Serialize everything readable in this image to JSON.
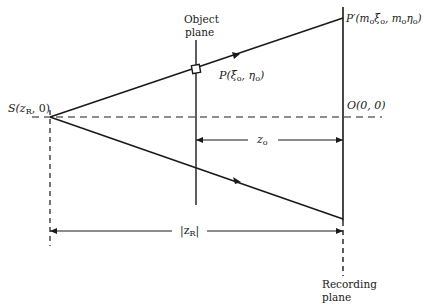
{
  "diagram": {
    "type": "holographic-recording-geometry",
    "labels": {
      "source": "S(z",
      "source_sub": "R",
      "source_tail": ", 0)",
      "object_plane_line1": "Object",
      "object_plane_line2": "plane",
      "object_point": "P(ξ",
      "object_point_sub1": "o",
      "object_point_mid": ", η",
      "object_point_sub2": "o",
      "object_point_tail": ")",
      "image_point": "P′(m",
      "image_point_sub1": "o",
      "image_point_mid1": "ξ",
      "image_point_sub2": "o",
      "image_point_mid2": ", m",
      "image_point_sub3": "o",
      "image_point_mid3": "η",
      "image_point_sub4": "o",
      "image_point_tail": ")",
      "origin": "O(0, 0)",
      "z_o": "z",
      "z_o_sub": "o",
      "z_r": "|z",
      "z_r_sub": "R",
      "z_r_tail": "|",
      "recording_plane_line1": "Recording",
      "recording_plane_line2": "plane"
    },
    "colors": {
      "line": "#1a1a1a",
      "background": "#ffffff"
    }
  }
}
